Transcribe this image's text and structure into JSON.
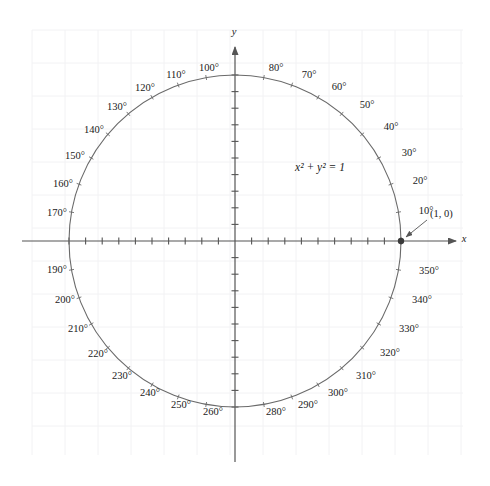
{
  "figure": {
    "width": 490,
    "height": 486,
    "background_color": "#ffffff",
    "grid": {
      "color": "#f2f2f4",
      "cell_size": 33,
      "left": 32,
      "top": 30,
      "right": 463,
      "bottom": 455,
      "visible": true
    },
    "axes": {
      "x_label": "x",
      "y_label": "y",
      "color": "#555555",
      "x_label_pos": [
        464,
        240
      ],
      "y_label_pos": [
        234,
        33
      ],
      "origin": [
        235,
        241
      ],
      "x_start": 22,
      "x_end": 456,
      "y_start": 47,
      "y_end": 462,
      "tick_spacing": 16.6,
      "ticks_per_radius": 10,
      "tick_half_length": 3.5
    },
    "circle": {
      "cx": 235,
      "cy": 241,
      "r": 166,
      "stroke_color": "#6a6a6a",
      "stroke_width": 1.1,
      "fill": "none"
    },
    "equation": {
      "text": "x² + y² = 1",
      "x": 320,
      "y": 168
    },
    "point": {
      "label": "(1, 0)",
      "label_x": 430,
      "label_y": 215,
      "marker_x": 401,
      "marker_y": 241,
      "marker_radius": 3.2,
      "marker_color": "#3a3a3a",
      "arrow_from": [
        427,
        220
      ],
      "arrow_to": [
        406,
        237
      ]
    }
  },
  "chart_data": {
    "type": "scatter",
    "xlabel": "x",
    "ylabel": "y",
    "xlim": [
      -1.28,
      1.33
    ],
    "ylim": [
      -1.33,
      1.28
    ],
    "grid": true,
    "legend": null,
    "annotations": [
      {
        "text": "x² + y² = 1",
        "x": 0.51,
        "y": 0.44
      },
      {
        "text": "(1, 0)",
        "x": 1.17,
        "y": 0.16
      }
    ],
    "series": [
      {
        "name": "unit circle",
        "type": "circle",
        "center": [
          0,
          0
        ],
        "radius": 1
      },
      {
        "name": "point (1, 0)",
        "type": "point",
        "x": [
          1
        ],
        "y": [
          0
        ]
      }
    ],
    "degree_ticks_omitted": [
      0,
      90,
      180,
      270
    ],
    "degree_labels": [
      {
        "deg": 10,
        "text": "10°",
        "x": 426,
        "y": 212
      },
      {
        "deg": 20,
        "text": "20°",
        "x": 420,
        "y": 182
      },
      {
        "deg": 30,
        "text": "30°",
        "x": 409,
        "y": 154
      },
      {
        "deg": 40,
        "text": "40°",
        "x": 391,
        "y": 128
      },
      {
        "deg": 50,
        "text": "50°",
        "x": 367,
        "y": 106
      },
      {
        "deg": 60,
        "text": "60°",
        "x": 339,
        "y": 88
      },
      {
        "deg": 70,
        "text": "70°",
        "x": 309,
        "y": 76
      },
      {
        "deg": 80,
        "text": "80°",
        "x": 276,
        "y": 69
      },
      {
        "deg": 100,
        "text": "100°",
        "x": 209,
        "y": 69
      },
      {
        "deg": 110,
        "text": "110°",
        "x": 176,
        "y": 76
      },
      {
        "deg": 120,
        "text": "120°",
        "x": 145,
        "y": 89
      },
      {
        "deg": 130,
        "text": "130°",
        "x": 117,
        "y": 108
      },
      {
        "deg": 140,
        "text": "140°",
        "x": 94,
        "y": 131
      },
      {
        "deg": 150,
        "text": "150°",
        "x": 75,
        "y": 157
      },
      {
        "deg": 160,
        "text": "160°",
        "x": 63,
        "y": 185
      },
      {
        "deg": 170,
        "text": "170°",
        "x": 57,
        "y": 214
      },
      {
        "deg": 190,
        "text": "190°",
        "x": 57,
        "y": 271
      },
      {
        "deg": 200,
        "text": "200°",
        "x": 65,
        "y": 301
      },
      {
        "deg": 210,
        "text": "210°",
        "x": 78,
        "y": 330
      },
      {
        "deg": 220,
        "text": "220°",
        "x": 98,
        "y": 355
      },
      {
        "deg": 230,
        "text": "230°",
        "x": 122,
        "y": 377
      },
      {
        "deg": 240,
        "text": "240°",
        "x": 150,
        "y": 394
      },
      {
        "deg": 250,
        "text": "250°",
        "x": 181,
        "y": 406
      },
      {
        "deg": 260,
        "text": "260°",
        "x": 213,
        "y": 413
      },
      {
        "deg": 280,
        "text": "280°",
        "x": 276,
        "y": 413
      },
      {
        "deg": 290,
        "text": "290°",
        "x": 308,
        "y": 406
      },
      {
        "deg": 300,
        "text": "300°",
        "x": 338,
        "y": 394
      },
      {
        "deg": 310,
        "text": "310°",
        "x": 366,
        "y": 377
      },
      {
        "deg": 320,
        "text": "320°",
        "x": 390,
        "y": 354
      },
      {
        "deg": 330,
        "text": "330°",
        "x": 409,
        "y": 330
      },
      {
        "deg": 340,
        "text": "340°",
        "x": 422,
        "y": 301
      },
      {
        "deg": 350,
        "text": "350°",
        "x": 429,
        "y": 272
      }
    ]
  }
}
